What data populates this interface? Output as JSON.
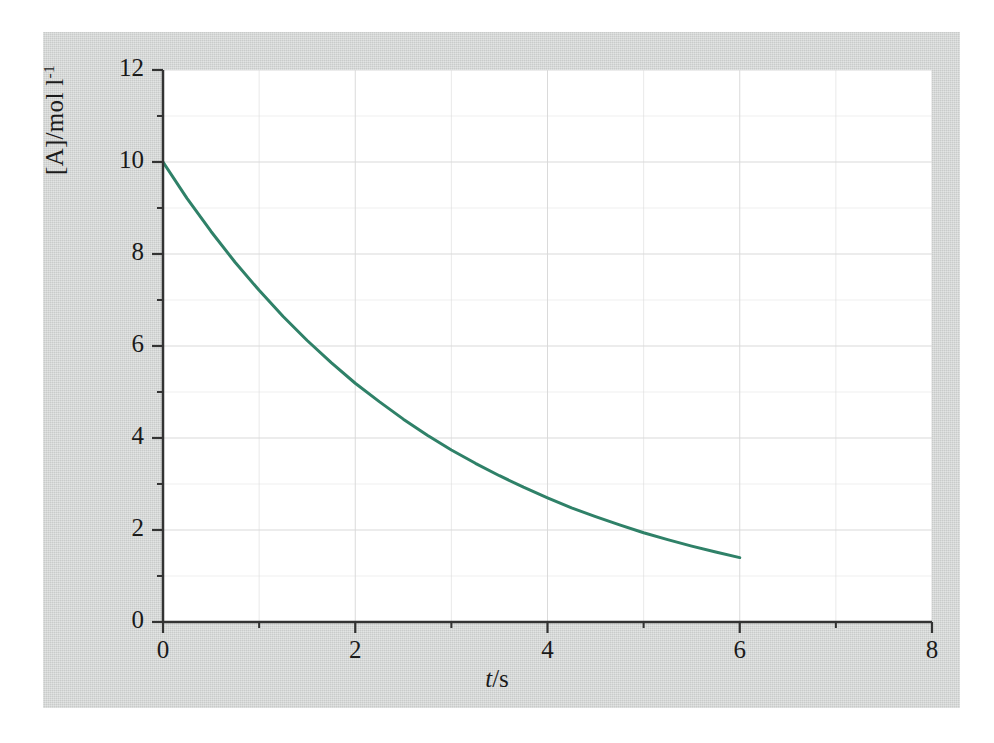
{
  "chart_data": {
    "type": "line",
    "title": "",
    "xlabel": "t/s",
    "ylabel": "[A]/mol l-1",
    "ylabel_parts": {
      "base": "[A]/mol l",
      "exponent": "-1"
    },
    "xlabel_parts": {
      "variable": "t",
      "separator": "/",
      "unit": "s"
    },
    "xlim": [
      0,
      8
    ],
    "ylim": [
      0,
      12
    ],
    "x_major_ticks": [
      0,
      2,
      4,
      6,
      8
    ],
    "x_minor_ticks": [
      1,
      3,
      5,
      7
    ],
    "y_major_ticks": [
      0,
      2,
      4,
      6,
      8,
      10,
      12
    ],
    "y_minor_ticks": [
      1,
      3,
      5,
      7,
      9,
      11
    ],
    "x_tick_labels": [
      "0",
      "2",
      "4",
      "6",
      "8"
    ],
    "y_tick_labels": [
      "0",
      "2",
      "4",
      "6",
      "8",
      "10",
      "12"
    ],
    "grid": true,
    "grid_color": "#d9d9d9",
    "legend": null,
    "series": [
      {
        "name": "[A]",
        "color": "#2f8168",
        "line_width": 3,
        "x": [
          0,
          0.25,
          0.5,
          0.75,
          1,
          1.25,
          1.5,
          1.75,
          2,
          2.25,
          2.5,
          2.75,
          3,
          3.25,
          3.5,
          3.75,
          4,
          4.25,
          4.5,
          4.75,
          5,
          5.25,
          5.5,
          5.75,
          6
        ],
        "values": [
          10.0,
          9.21,
          8.49,
          7.82,
          7.21,
          6.64,
          6.12,
          5.64,
          5.19,
          4.79,
          4.41,
          4.06,
          3.74,
          3.45,
          3.18,
          2.93,
          2.7,
          2.48,
          2.29,
          2.11,
          1.94,
          1.79,
          1.65,
          1.52,
          1.4
        ]
      }
    ],
    "annotations": []
  },
  "figure": {
    "page_background": "#ffffff",
    "panel_background": "#d2d4d3",
    "plot_background": "#ffffff",
    "axis_color": "#333333",
    "curve_color": "#2f8168"
  }
}
